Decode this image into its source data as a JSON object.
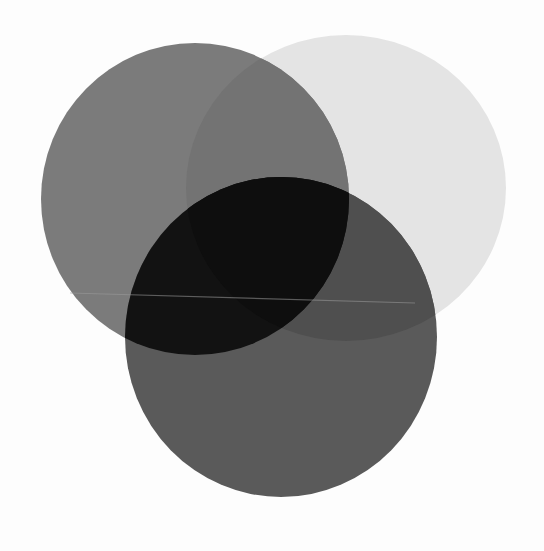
{
  "image": {
    "description": "Three overlapping translucent grey circular filters on a white background",
    "background": "#fdfdfd",
    "circles": [
      {
        "name": "circle-top-left",
        "cx": 195,
        "cy": 199,
        "rx": 154,
        "ry": 156,
        "color": "#7b7b7b"
      },
      {
        "name": "circle-top-right",
        "cx": 346,
        "cy": 188,
        "rx": 160,
        "ry": 153,
        "color": "#e4e4e4"
      },
      {
        "name": "circle-bottom",
        "cx": 281,
        "cy": 337,
        "rx": 156,
        "ry": 160,
        "color": "#5a5a5a"
      }
    ],
    "overlaps": {
      "top_left_and_top_right": "#737373",
      "top_left_and_bottom": "#121212",
      "top_right_and_bottom": "#4f4f4f",
      "all_three": "#0e0e0e"
    },
    "scan_line": {
      "x1": 70,
      "y1": 293,
      "x2": 415,
      "y2": 303,
      "color": "#9a9a9a"
    }
  }
}
